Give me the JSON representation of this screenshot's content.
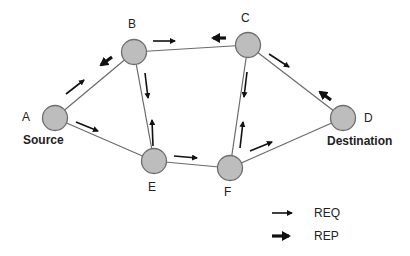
{
  "diagram": {
    "type": "network-route-discovery",
    "nodes": [
      {
        "id": "A",
        "label": "A",
        "role": "Source",
        "x": 55,
        "y": 118
      },
      {
        "id": "B",
        "label": "B",
        "x": 134,
        "y": 52
      },
      {
        "id": "C",
        "label": "C",
        "x": 248,
        "y": 45
      },
      {
        "id": "D",
        "label": "D",
        "role": "Destination",
        "x": 343,
        "y": 118
      },
      {
        "id": "E",
        "label": "E",
        "x": 154,
        "y": 161
      },
      {
        "id": "F",
        "label": "F",
        "x": 230,
        "y": 168
      }
    ],
    "edges": [
      [
        "A",
        "B"
      ],
      [
        "A",
        "E"
      ],
      [
        "B",
        "C"
      ],
      [
        "B",
        "E"
      ],
      [
        "C",
        "D"
      ],
      [
        "C",
        "F"
      ],
      [
        "E",
        "F"
      ],
      [
        "F",
        "D"
      ]
    ],
    "messages": [
      {
        "type": "REQ",
        "from": "A",
        "to": "B"
      },
      {
        "type": "REQ",
        "from": "A",
        "to": "E"
      },
      {
        "type": "REQ",
        "from": "B",
        "to": "C"
      },
      {
        "type": "REQ",
        "from": "B",
        "to": "E"
      },
      {
        "type": "REQ",
        "from": "E",
        "to": "B"
      },
      {
        "type": "REQ",
        "from": "E",
        "to": "F"
      },
      {
        "type": "REQ",
        "from": "C",
        "to": "D"
      },
      {
        "type": "REQ",
        "from": "C",
        "to": "F"
      },
      {
        "type": "REQ",
        "from": "F",
        "to": "C"
      },
      {
        "type": "REQ",
        "from": "F",
        "to": "D"
      },
      {
        "type": "REP",
        "from": "D",
        "to": "C"
      },
      {
        "type": "REP",
        "from": "C",
        "to": "B"
      },
      {
        "type": "REP",
        "from": "B",
        "to": "A"
      }
    ],
    "labels": {
      "A": "A",
      "B": "B",
      "C": "C",
      "D": "D",
      "E": "E",
      "F": "F",
      "source": "Source",
      "destination": "Destination"
    },
    "legend": {
      "req_label": "REQ",
      "rep_label": "REP"
    },
    "colors": {
      "node_fill": "#bdbdbd",
      "node_stroke": "#6e6e6e",
      "edge": "#6a6a6a",
      "arrow": "#111111"
    }
  }
}
